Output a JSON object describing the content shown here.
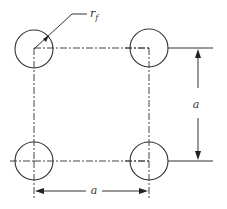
{
  "diagram": {
    "stroke_color": "#333333",
    "background": "#ffffff",
    "fiber_radius_label": {
      "main": "r",
      "subscript": "f"
    },
    "spacing_label_vertical": "a",
    "spacing_label_horizontal": "a",
    "fibers": [
      {
        "id": "top-left",
        "cx": 34,
        "cy": 49,
        "r": 19
      },
      {
        "id": "top-right",
        "cx": 149,
        "cy": 48,
        "r": 19
      },
      {
        "id": "bottom-left",
        "cx": 34,
        "cy": 161,
        "r": 19
      },
      {
        "id": "bottom-right",
        "cx": 149,
        "cy": 161,
        "r": 19
      }
    ],
    "unit_cell": {
      "x1": 34,
      "y1": 48,
      "x2": 149,
      "y2": 161,
      "style": "dash-dot"
    }
  }
}
